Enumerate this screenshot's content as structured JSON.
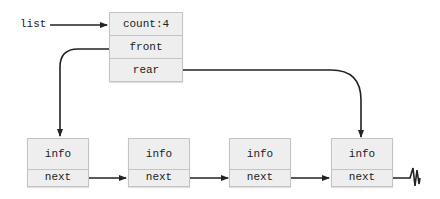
{
  "diagram": {
    "pointer_label": "list",
    "header": {
      "fields": [
        "count:4",
        "front",
        "rear"
      ]
    },
    "nodes": [
      {
        "info": "info",
        "next": "next"
      },
      {
        "info": "info",
        "next": "next"
      },
      {
        "info": "info",
        "next": "next"
      },
      {
        "info": "info",
        "next": "next"
      }
    ],
    "terminator": "null-lightning",
    "colors": {
      "box_fill": "#eeeeee",
      "box_border": "#c4c4c4",
      "line": "#222222"
    }
  }
}
